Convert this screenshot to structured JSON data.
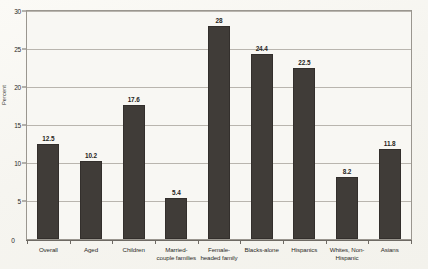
{
  "chart_data": {
    "type": "bar",
    "title": "",
    "xlabel": "",
    "ylabel": "Percent",
    "ylim": [
      0,
      30
    ],
    "ytick_labels": [
      "0",
      "5",
      "10",
      "15",
      "20",
      "25",
      "30"
    ],
    "yticks": [
      0,
      5,
      10,
      15,
      20,
      25,
      30
    ],
    "grid": true,
    "legend": "none",
    "categories": [
      "Overall",
      "Aged",
      "Children",
      "Married-couple families",
      "Female-headed family",
      "Blacks-alone",
      "Hispanics",
      "Whites, Non-Hispanic",
      "Asians"
    ],
    "category_lines": [
      [
        "Overall"
      ],
      [
        "Aged"
      ],
      [
        "Children"
      ],
      [
        "Married-",
        "couple families"
      ],
      [
        "Female-",
        "headed family"
      ],
      [
        "Blacks-alone"
      ],
      [
        "Hispanics"
      ],
      [
        "Whites, Non-",
        "Hispanic"
      ],
      [
        "Asians"
      ]
    ],
    "values": [
      12.5,
      10.2,
      17.6,
      5.4,
      28,
      24.4,
      22.5,
      8.2,
      11.8
    ],
    "value_labels": [
      "12.5",
      "10.2",
      "17.6",
      "5.4",
      "28",
      "24.4",
      "22.5",
      "8.2",
      "11.8"
    ],
    "bar_color": "#403c38",
    "plot_background": "#f8f7f3",
    "gridline_color": "#b9b5ae",
    "axis_color": "#6e6a64"
  }
}
